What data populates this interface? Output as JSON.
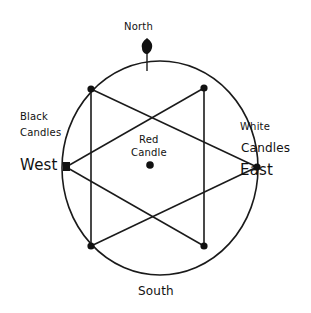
{
  "diagram": {
    "labels": {
      "north": "North",
      "south": "South",
      "west": "West",
      "east": "East",
      "black_line1": "Black",
      "black_line2": "Candles",
      "white_line1": "White",
      "white_line2": "Candles",
      "red_line1": "Red",
      "red_line2": "Candle"
    },
    "elements": {
      "outer_shape": "ellipse",
      "inner_shape": "hexagram (two overlapping triangles)",
      "vertex_count": 6,
      "markers": [
        "north-candle",
        "red-candle-center"
      ]
    },
    "colors": {
      "ink": "#111111",
      "background": "#ffffff"
    }
  }
}
